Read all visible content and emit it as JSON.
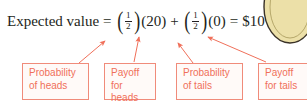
{
  "figure": {
    "type": "annotated-equation-diagram",
    "accent_color": "#f0705a",
    "box_border_color": "#f08b7a",
    "box_fill_color": "#fffaf8",
    "equation_color": "#231f20",
    "coin_color": "#e8dca0",
    "background": "#ffffff"
  },
  "equation": {
    "label": "Expected value",
    "equals": "=",
    "term1": {
      "open_paren": "(",
      "numerator": "1",
      "denominator": "2",
      "close_paren": ")",
      "multiplier": "(20)"
    },
    "plus": "+",
    "term2": {
      "open_paren": "(",
      "numerator": "1",
      "denominator": "2",
      "close_paren": ")",
      "multiplier": "(0)"
    },
    "equals2": "=",
    "result": "$10"
  },
  "callouts": [
    {
      "id": "probability-of-heads",
      "text": "Probability\nof heads"
    },
    {
      "id": "payoff-for-heads",
      "text": "Payoff for\nheads"
    },
    {
      "id": "probability-of-tails",
      "text": "Probability\nof tails"
    },
    {
      "id": "payoff-for-tails",
      "text": "Payoff\nfor tails"
    }
  ],
  "arrows": [
    {
      "id": "arrow-probability-heads",
      "from": [
        79,
        63
      ],
      "to": [
        105,
        41
      ]
    },
    {
      "id": "arrow-payoff-heads",
      "from": [
        134,
        62
      ],
      "to": [
        139,
        37
      ]
    },
    {
      "id": "arrow-probability-tails",
      "from": [
        193,
        63
      ],
      "to": [
        178,
        43
      ]
    },
    {
      "id": "arrow-payoff-tails",
      "from": [
        266,
        62
      ],
      "to": [
        208,
        37
      ]
    }
  ]
}
